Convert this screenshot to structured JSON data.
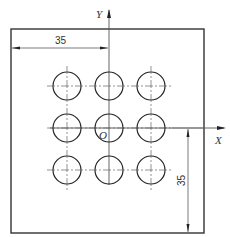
{
  "drawing": {
    "axis_x_label": "X",
    "axis_y_label": "Y",
    "origin_label": "O",
    "dim_horizontal": "35",
    "dim_vertical": "35",
    "hole_grid": {
      "rows": 3,
      "cols": 3
    },
    "colors": {
      "line": "#222222",
      "centerline": "#555555",
      "dimension": "#444444"
    }
  }
}
